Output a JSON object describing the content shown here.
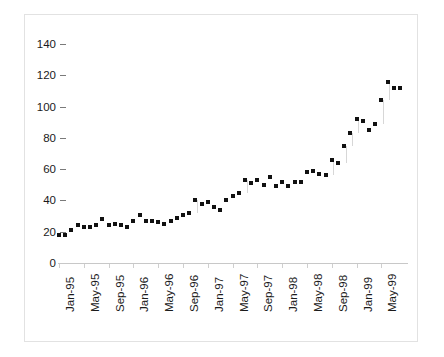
{
  "chart_data": {
    "type": "scatter",
    "title": "",
    "subtitle": "",
    "xlabel": "",
    "ylabel": "",
    "grid": false,
    "legend": "none",
    "ylim": [
      0,
      140
    ],
    "y_ticks": [
      0,
      20,
      40,
      60,
      80,
      100,
      120,
      140
    ],
    "y_tick_labels": [
      "0",
      "20",
      "40",
      "60",
      "80",
      "100",
      "120",
      "140"
    ],
    "x_tick_labels": [
      "Jan-95",
      "May-95",
      "Sep-95",
      "Jan-96",
      "May-96",
      "Sep-96",
      "Jan-97",
      "May-97",
      "Sep-97",
      "Jan-98",
      "May-98",
      "Sep-98",
      "Jan-99",
      "May-99"
    ],
    "x_tick_interval_months": 4,
    "x": [
      "Jan-95",
      "Feb-95",
      "Mar-95",
      "Apr-95",
      "May-95",
      "Jun-95",
      "Jul-95",
      "Aug-95",
      "Sep-95",
      "Oct-95",
      "Nov-95",
      "Dec-95",
      "Jan-96",
      "Feb-96",
      "Mar-96",
      "Apr-96",
      "May-96",
      "Jun-96",
      "Jul-96",
      "Aug-96",
      "Sep-96",
      "Oct-96",
      "Nov-96",
      "Dec-96",
      "Jan-97",
      "Feb-97",
      "Mar-97",
      "Apr-97",
      "May-97",
      "Jun-97",
      "Jul-97",
      "Aug-97",
      "Sep-97",
      "Oct-97",
      "Nov-97",
      "Dec-97",
      "Jan-98",
      "Feb-98",
      "Mar-98",
      "Apr-98",
      "May-98",
      "Jun-98",
      "Jul-98",
      "Aug-98",
      "Sep-98",
      "Oct-98",
      "Nov-98",
      "Dec-98",
      "Jan-99",
      "Feb-99",
      "Mar-99",
      "Apr-99",
      "May-99",
      "Jun-99",
      "Jul-99",
      "Aug-99"
    ],
    "values": [
      18,
      18,
      21,
      24,
      23,
      23,
      24,
      28,
      24,
      25,
      24,
      23,
      27,
      31,
      27,
      27,
      26,
      25,
      27,
      29,
      31,
      32,
      40,
      38,
      39,
      36,
      34,
      40,
      43,
      45,
      53,
      51,
      53,
      50,
      55,
      49,
      52,
      49,
      52,
      52,
      58,
      59,
      57,
      56,
      66,
      64,
      75,
      83,
      92,
      91,
      85,
      89,
      104,
      116,
      112,
      112
    ],
    "series_name": "value",
    "marker": "square",
    "marker_color": "#111111"
  },
  "figure": {
    "background_color": "#ffffff",
    "frame_color": "#e2e2e2",
    "axis_color": "#c8c8c8"
  }
}
